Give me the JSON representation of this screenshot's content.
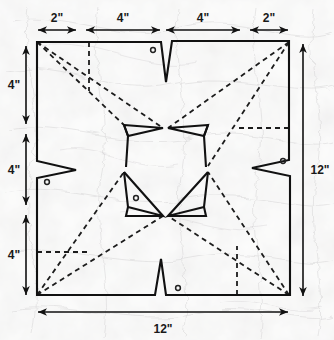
{
  "diagram": {
    "units": "inches",
    "colors": {
      "background": "#f1f1ef",
      "outline": "#111111",
      "fold_line": "#1a1a1a",
      "dimension": "#111111",
      "hole": "#222222"
    },
    "dimensions": {
      "top": [
        {
          "id": "top-seg-1",
          "label": "2\"",
          "value": 2
        },
        {
          "id": "top-seg-2",
          "label": "4\"",
          "value": 4
        },
        {
          "id": "top-seg-3",
          "label": "4\"",
          "value": 4
        },
        {
          "id": "top-seg-4",
          "label": "2\"",
          "value": 2
        }
      ],
      "left": [
        {
          "id": "left-seg-1",
          "label": "4\"",
          "value": 4
        },
        {
          "id": "left-seg-2",
          "label": "4\"",
          "value": 4
        },
        {
          "id": "left-seg-3",
          "label": "4\"",
          "value": 4
        }
      ],
      "right": [
        {
          "id": "right-overall",
          "label": "12\"",
          "value": 12
        }
      ],
      "bottom": [
        {
          "id": "bottom-overall",
          "label": "12\"",
          "value": 12
        }
      ]
    },
    "holes": [
      {
        "id": "hole-top",
        "cx": 153,
        "cy": 50
      },
      {
        "id": "hole-left",
        "cx": 47,
        "cy": 182
      },
      {
        "id": "hole-right",
        "cx": 283,
        "cy": 163
      },
      {
        "id": "hole-center",
        "cx": 136,
        "cy": 198
      },
      {
        "id": "hole-bottom",
        "cx": 178,
        "cy": 288
      }
    ],
    "notches": [
      {
        "id": "notch-top",
        "edge": "top",
        "direction": "down"
      },
      {
        "id": "notch-left",
        "edge": "left",
        "direction": "right"
      },
      {
        "id": "notch-right",
        "edge": "right",
        "direction": "left"
      },
      {
        "id": "notch-bottom",
        "edge": "bottom",
        "direction": "up"
      }
    ],
    "inner_cutouts": [
      {
        "id": "inner-cut-top-left"
      },
      {
        "id": "inner-cut-top-right"
      },
      {
        "id": "inner-cut-bottom-left"
      },
      {
        "id": "inner-cut-bottom-right"
      }
    ],
    "fold_lines": {
      "diagonals": 4,
      "extra_vertical": 2,
      "extra_horizontal": 2
    }
  }
}
